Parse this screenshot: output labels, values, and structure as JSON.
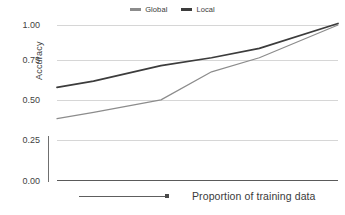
{
  "chart_data": {
    "type": "line",
    "title": "",
    "xlabel": "Proportion of training data",
    "ylabel": "Accuracy",
    "xlim": [
      0,
      1
    ],
    "ylim": [
      0,
      1
    ],
    "grid": true,
    "legend_position": "top-center",
    "yticks": [
      "1.00",
      "0.75",
      "0.50",
      "0.25",
      "0.00"
    ],
    "ytick_values": [
      1.0,
      0.75,
      0.5,
      0.25,
      0.0
    ],
    "xticks": [],
    "x": [
      0.0,
      0.13,
      0.37,
      0.55,
      0.72,
      1.0
    ],
    "series": [
      {
        "name": "Global",
        "color": "#8c8c8c",
        "values": [
          0.4,
          0.44,
          0.52,
          0.7,
          0.79,
          1.0
        ]
      },
      {
        "name": "Local",
        "color": "#3c3c3c",
        "values": [
          0.6,
          0.64,
          0.74,
          0.79,
          0.85,
          1.01
        ]
      }
    ]
  },
  "legend": {
    "items": [
      {
        "label": "Global",
        "color": "#8c8c8c"
      },
      {
        "label": "Local",
        "color": "#3c3c3c"
      }
    ]
  },
  "axes": {
    "y_title": "Accuracy",
    "x_caption": "Proportion of training data"
  },
  "colors": {
    "gridline": "#d6d6d6",
    "baseline": "#5a5a5a",
    "text": "#3f3f3f",
    "axis_stub": "#6f6f6f"
  }
}
